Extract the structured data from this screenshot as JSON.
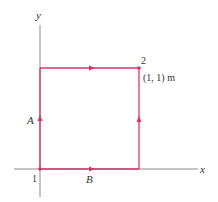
{
  "diagram": {
    "axes": {
      "x_label": "x",
      "y_label": "y",
      "color": "#8a8a8a"
    },
    "path": {
      "color": "#d9336b",
      "corners": {
        "origin": {
          "px": [
            40,
            169
          ]
        },
        "top_left": {
          "px": [
            40,
            68
          ]
        },
        "top_right": {
          "px": [
            139,
            68
          ]
        },
        "bottom_right": {
          "px": [
            139,
            169
          ]
        }
      }
    },
    "labels": {
      "point1": "1",
      "point2": "2",
      "point2_coords": "(1, 1) m",
      "path_a": "A",
      "path_b": "B"
    }
  }
}
